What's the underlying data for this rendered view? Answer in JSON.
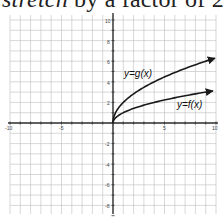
{
  "heading": {
    "emph": "stretch",
    "rest": " by a factor of 2"
  },
  "chart_data": {
    "type": "line",
    "title": "stretch by a factor of 2",
    "xlabel": "",
    "ylabel": "",
    "xlim": [
      -10,
      10
    ],
    "ylim": [
      -9,
      10
    ],
    "grid": true,
    "x_ticks_labeled": [
      -10,
      -5,
      5,
      10
    ],
    "y_ticks_labeled": [
      10,
      8,
      6,
      4,
      2,
      -2,
      -4,
      -6,
      -8
    ],
    "series": [
      {
        "name": "y=g(x)",
        "formula": "g(x) = 2*sqrt(x)",
        "x": [
          0,
          1,
          2,
          4,
          6,
          8,
          10
        ],
        "values": [
          0,
          2,
          2.83,
          4,
          4.9,
          5.66,
          6.32
        ]
      },
      {
        "name": "y=f(x)",
        "formula": "f(x) = sqrt(x)",
        "x": [
          0,
          1,
          2,
          4,
          6,
          8,
          10
        ],
        "values": [
          0,
          1,
          1.41,
          2,
          2.45,
          2.83,
          3.16
        ]
      }
    ],
    "annotations": [
      "y=g(x)",
      "y=f(x)"
    ]
  },
  "labels": {
    "g": "y=g(x)",
    "f": "y=f(x)",
    "xm10": "-10",
    "xm5": "-5",
    "x5": "5",
    "x10": "10",
    "y10": "10",
    "y8": "8",
    "y6": "6",
    "y4": "4",
    "y2": "2",
    "ym2": "-2",
    "ym4": "-4",
    "ym6": "-6",
    "ym8": "-8"
  },
  "colors": {
    "grid": "#bdbdbd",
    "axis": "#333333",
    "curve": "#1a1a1a"
  }
}
